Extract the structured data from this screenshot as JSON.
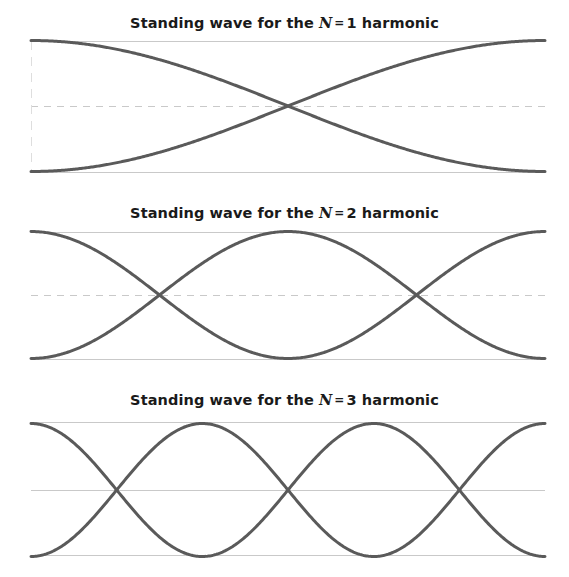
{
  "figure": {
    "width": 569,
    "height": 577,
    "background": "#ffffff",
    "curve_color": "#5a5a5a",
    "guide_color": "#c9c9c9",
    "text_color": "#1a1a1a"
  },
  "panels": [
    {
      "id": "harmonic-1",
      "title_prefix": "Standing wave for the ",
      "title_variable": "N",
      "title_equals": "=",
      "title_value": "1",
      "title_suffix": " harmonic",
      "title_full": "Standing wave for the N = 1 harmonic",
      "harmonic_number": 1,
      "nodes": 0,
      "antinodes": 1,
      "midline_style": "dashed",
      "has_left_axis_line": true,
      "title_y": 18,
      "box": {
        "x0": 31,
        "x1": 545,
        "top": 41,
        "mid": 106,
        "bottom": 172
      }
    },
    {
      "id": "harmonic-2",
      "title_prefix": "Standing wave for the ",
      "title_variable": "N",
      "title_equals": "=",
      "title_value": "2",
      "title_suffix": " harmonic",
      "title_full": "Standing wave for the N = 2 harmonic",
      "harmonic_number": 2,
      "nodes": 1,
      "antinodes": 2,
      "midline_style": "dashed",
      "has_left_axis_line": false,
      "title_y": 208,
      "box": {
        "x0": 31,
        "x1": 545,
        "top": 232,
        "mid": 295,
        "bottom": 359
      }
    },
    {
      "id": "harmonic-3",
      "title_prefix": "Standing wave for the ",
      "title_variable": "N",
      "title_equals": "=",
      "title_value": "3",
      "title_suffix": " harmonic",
      "title_full": "Standing wave for the N = 3 harmonic",
      "harmonic_number": 3,
      "nodes": 2,
      "antinodes": 3,
      "midline_style": "solid",
      "has_left_axis_line": false,
      "title_y": 395,
      "box": {
        "x0": 31,
        "x1": 545,
        "top": 422,
        "mid": 490,
        "bottom": 555
      }
    }
  ],
  "chart_data": {
    "type": "line",
    "xlabel": "",
    "ylabel": "",
    "grid": true,
    "legend": "none",
    "xlim": [
      0,
      1
    ],
    "ylim": [
      -1,
      1
    ],
    "charts": [
      {
        "panel": "harmonic-1",
        "title": "Standing wave for the N = 1 harmonic",
        "x": [
          0,
          0.1,
          0.2,
          0.3,
          0.4,
          0.5,
          0.6,
          0.7,
          0.8,
          0.9,
          1.0
        ],
        "series": [
          {
            "name": "y = +cos(pi x)",
            "values": [
              1.0,
              0.951,
              0.809,
              0.588,
              0.309,
              0.0,
              -0.309,
              -0.588,
              -0.809,
              -0.951,
              -1.0
            ]
          },
          {
            "name": "y = -cos(pi x)",
            "values": [
              -1.0,
              -0.951,
              -0.809,
              -0.588,
              -0.309,
              0.0,
              0.309,
              0.588,
              0.809,
              0.951,
              1.0
            ]
          }
        ],
        "node_positions": [
          0.5
        ],
        "antinode_positions": [
          0.0,
          1.0
        ]
      },
      {
        "panel": "harmonic-2",
        "title": "Standing wave for the N = 2 harmonic",
        "x": [
          0,
          0.1,
          0.2,
          0.3,
          0.4,
          0.5,
          0.6,
          0.7,
          0.8,
          0.9,
          1.0
        ],
        "series": [
          {
            "name": "y = +cos(2 pi x)",
            "values": [
              1.0,
              0.809,
              0.309,
              -0.309,
              -0.809,
              -1.0,
              -0.809,
              -0.309,
              0.309,
              0.809,
              1.0
            ]
          },
          {
            "name": "y = -cos(2 pi x)",
            "values": [
              -1.0,
              -0.809,
              -0.309,
              0.309,
              0.809,
              1.0,
              0.809,
              0.309,
              -0.309,
              -0.809,
              -1.0
            ]
          }
        ],
        "node_positions": [
          0.25,
          0.75
        ],
        "antinode_positions": [
          0.0,
          0.5,
          1.0
        ]
      },
      {
        "panel": "harmonic-3",
        "title": "Standing wave for the N = 3 harmonic",
        "x": [
          0,
          0.1,
          0.2,
          0.3,
          0.4,
          0.5,
          0.6,
          0.7,
          0.8,
          0.9,
          1.0
        ],
        "series": [
          {
            "name": "y = +cos(3 pi x)",
            "values": [
              1.0,
              0.588,
              -0.309,
              -0.951,
              -0.809,
              0.0,
              0.809,
              0.951,
              0.309,
              -0.588,
              -1.0
            ]
          },
          {
            "name": "y = -cos(3 pi x)",
            "values": [
              -1.0,
              -0.588,
              0.309,
              0.951,
              0.809,
              0.0,
              -0.809,
              -0.951,
              -0.309,
              0.588,
              1.0
            ]
          }
        ],
        "node_positions": [
          0.1667,
          0.5,
          0.8333
        ],
        "antinode_positions": [
          0.0,
          0.3333,
          0.6667,
          1.0
        ]
      }
    ]
  }
}
